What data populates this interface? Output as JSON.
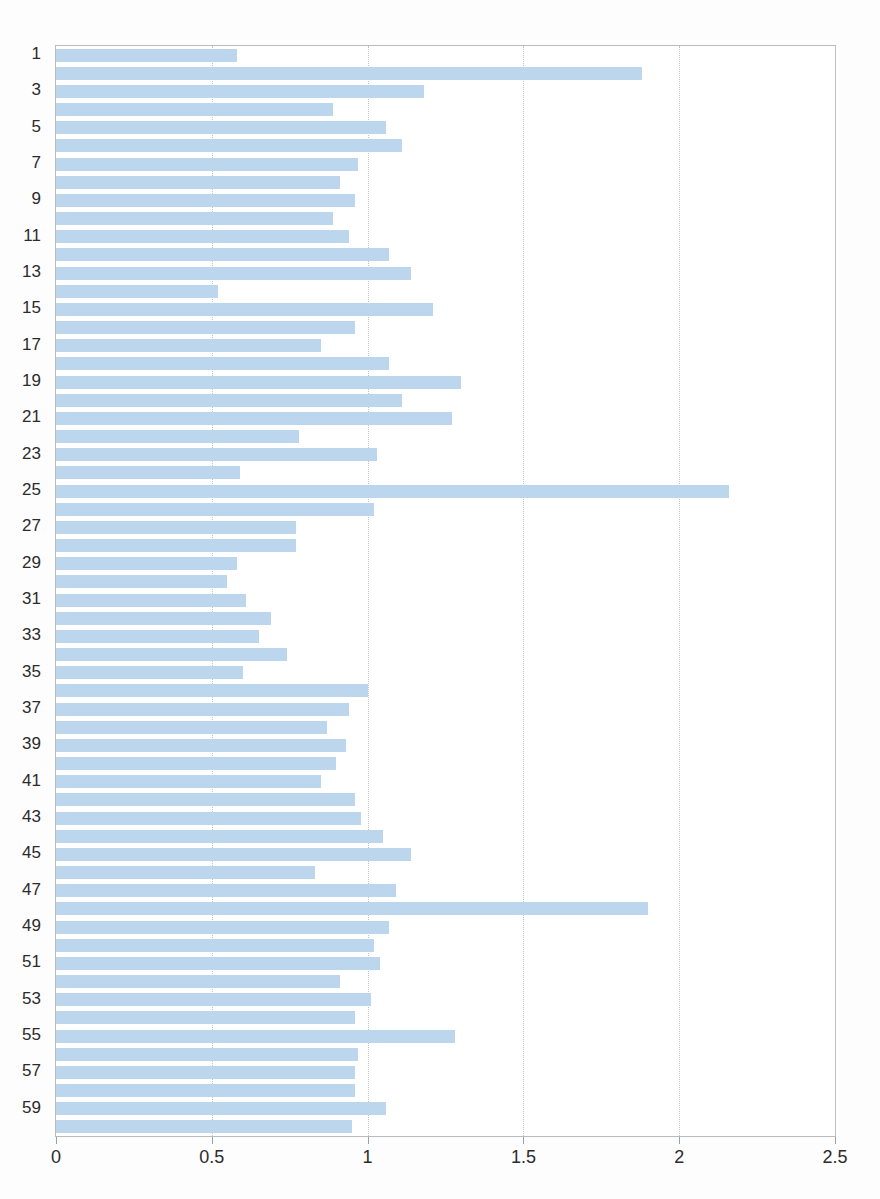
{
  "chart_data": {
    "type": "bar",
    "orientation": "horizontal",
    "title": "",
    "xlabel": "",
    "ylabel": "",
    "xlim": [
      0,
      2.5
    ],
    "xticks": [
      0,
      0.5,
      1,
      1.5,
      2,
      2.5
    ],
    "xtick_labels": [
      "0",
      "0.5",
      "1",
      "1.5",
      "2",
      "2.5"
    ],
    "yticks": [
      1,
      3,
      5,
      7,
      9,
      11,
      13,
      15,
      17,
      19,
      21,
      23,
      25,
      27,
      29,
      31,
      33,
      35,
      37,
      39,
      41,
      43,
      45,
      47,
      49,
      51,
      53,
      55,
      57,
      59
    ],
    "ytick_labels": [
      "1",
      "3",
      "5",
      "7",
      "9",
      "11",
      "13",
      "15",
      "17",
      "19",
      "21",
      "23",
      "25",
      "27",
      "29",
      "31",
      "33",
      "35",
      "37",
      "39",
      "41",
      "43",
      "45",
      "47",
      "49",
      "51",
      "53",
      "55",
      "57",
      "59"
    ],
    "grid": "vertical-dotted",
    "legend": null,
    "bar_color": "#bcd6ed",
    "frame_color": "#b9bcbe",
    "categories": [
      1,
      2,
      3,
      4,
      5,
      6,
      7,
      8,
      9,
      10,
      11,
      12,
      13,
      14,
      15,
      16,
      17,
      18,
      19,
      20,
      21,
      22,
      23,
      24,
      25,
      26,
      27,
      28,
      29,
      30,
      31,
      32,
      33,
      34,
      35,
      36,
      37,
      38,
      39,
      40,
      41,
      42,
      43,
      44,
      45,
      46,
      47,
      48,
      49,
      50,
      51,
      52,
      53,
      54,
      55,
      56,
      57,
      58,
      59,
      60
    ],
    "values": [
      0.58,
      1.88,
      1.18,
      0.89,
      1.06,
      1.11,
      0.97,
      0.91,
      0.96,
      0.89,
      0.94,
      1.07,
      1.14,
      0.52,
      1.21,
      0.96,
      0.85,
      1.07,
      1.3,
      1.11,
      1.27,
      0.78,
      1.03,
      0.59,
      2.16,
      1.02,
      0.77,
      0.77,
      0.58,
      0.55,
      0.61,
      0.69,
      0.65,
      0.74,
      0.6,
      1.0,
      0.94,
      0.87,
      0.93,
      0.9,
      0.85,
      0.96,
      0.98,
      1.05,
      1.14,
      0.83,
      1.09,
      1.9,
      1.07,
      1.02,
      1.04,
      0.91,
      1.01,
      0.96,
      1.28,
      0.97,
      0.96,
      0.96,
      1.06,
      0.95
    ]
  }
}
